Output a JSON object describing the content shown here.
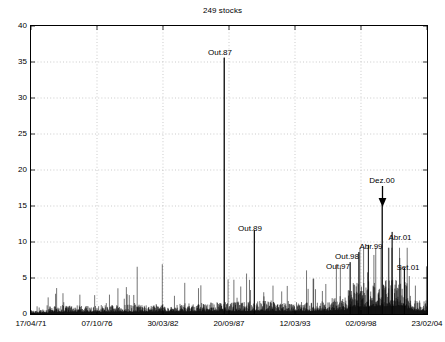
{
  "chart_data": {
    "type": "line",
    "title": "249 stocks",
    "xlabel": "",
    "ylabel": "",
    "ylim": [
      0,
      40
    ],
    "ytick_values": [
      0,
      5,
      10,
      15,
      20,
      25,
      30,
      35,
      40
    ],
    "ytick_labels": [
      "0",
      "5",
      "10",
      "15",
      "20",
      "25",
      "30",
      "35",
      "40"
    ],
    "xtick_labels": [
      "17/04/71",
      "07/10/76",
      "30/03/82",
      "20/09/87",
      "12/03/93",
      "02/09/98",
      "23/02/04"
    ],
    "xtick_positions": [
      0,
      0.16667,
      0.33333,
      0.5,
      0.66667,
      0.83333,
      1
    ],
    "grid": "dotted",
    "legend": "none",
    "line_color": "#000000",
    "series": [
      {
        "name": "number of outliers",
        "description": "daily spike counts, dense vertical impulse series from 17/04/71 to 23/02/04",
        "baseline": 0,
        "typical_range": [
          0,
          4
        ],
        "peaks": [
          {
            "label": "Out.87",
            "x": 0.488,
            "value": 35.6
          },
          {
            "label": "Out.89",
            "x": 0.564,
            "value": 11.6
          },
          {
            "label": "Out.97",
            "x": 0.806,
            "value": 7.2
          },
          {
            "label": "Out.98",
            "x": 0.828,
            "value": 8.6
          },
          {
            "label": "Abr.99",
            "x": 0.852,
            "value": 9.6
          },
          {
            "label": "Dez.00",
            "x": 0.887,
            "value": 15.2
          },
          {
            "label": "Abr.01",
            "x": 0.912,
            "value": 11.4
          },
          {
            "label": "Set.01",
            "x": 0.943,
            "value": 6.4
          }
        ]
      }
    ],
    "annotations": [
      {
        "name": "Out.87",
        "text": "Out.87",
        "px": 220,
        "py": 48,
        "arrow": false
      },
      {
        "name": "Out.89",
        "text": "Out.89",
        "px": 250,
        "py": 224,
        "arrow": false
      },
      {
        "name": "Out.97",
        "text": "Out.97",
        "px": 338,
        "py": 262,
        "arrow": false
      },
      {
        "name": "Out.98",
        "text": "Out.98",
        "px": 347,
        "py": 252,
        "arrow": false
      },
      {
        "name": "Abr.99",
        "text": "Abr.99",
        "px": 371,
        "py": 242,
        "arrow": false
      },
      {
        "name": "Dez.00",
        "text": "Dez.00",
        "px": 382,
        "py": 176,
        "arrow": true
      },
      {
        "name": "Abr.01",
        "text": "Abr.01",
        "px": 400,
        "py": 233,
        "arrow": false
      },
      {
        "name": "Set.01",
        "text": "Set.01",
        "px": 408,
        "py": 263,
        "arrow": false
      }
    ]
  }
}
